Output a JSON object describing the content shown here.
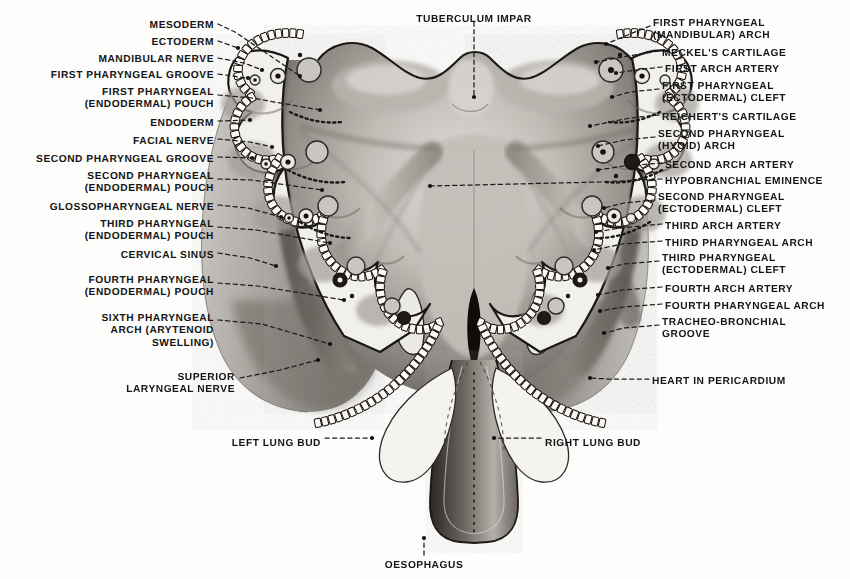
{
  "figure": {
    "type": "anatomical-illustration",
    "palette": {
      "paper": "#fdfdfc",
      "ink": "#151515",
      "arch_fill": "#f0efec",
      "tongue_mid": "#b5b0ab",
      "tongue_dark": "#6e6862",
      "tongue_light": "#d7d3ce",
      "body_grey": "#a8a39d",
      "body_dark": "#5e5954",
      "lumen_black": "#101010",
      "vessel_fill": "#c8c4bf",
      "leader": "#2a2a2a"
    }
  },
  "labels": {
    "top_center": [
      {
        "id": "tuberculum-impar",
        "text": "TUBERCULUM IMPAR",
        "x": 474,
        "y": 14,
        "align": "center"
      }
    ],
    "left": [
      {
        "id": "mesoderm",
        "text": "MESODERM",
        "x": 214,
        "y": 20,
        "align": "right"
      },
      {
        "id": "ectoderm",
        "text": "ECTODERM",
        "x": 214,
        "y": 37,
        "align": "right"
      },
      {
        "id": "mandibular-nerve",
        "text": "MANDIBULAR NERVE",
        "x": 214,
        "y": 54,
        "align": "right"
      },
      {
        "id": "first-pharyngeal-groove",
        "text": "FIRST PHARYNGEAL GROOVE",
        "x": 214,
        "y": 70,
        "align": "right"
      },
      {
        "id": "first-pharyngeal-pouch",
        "text": "FIRST PHARYNGEAL\n(ENDODERMAL) POUCH",
        "x": 214,
        "y": 87,
        "align": "right"
      },
      {
        "id": "endoderm",
        "text": "ENDODERM",
        "x": 214,
        "y": 118,
        "align": "right"
      },
      {
        "id": "facial-nerve",
        "text": "FACIAL NERVE",
        "x": 214,
        "y": 136,
        "align": "right"
      },
      {
        "id": "second-pharyngeal-groove",
        "text": "SECOND PHARYNGEAL GROOVE",
        "x": 214,
        "y": 154,
        "align": "right"
      },
      {
        "id": "second-pharyngeal-pouch",
        "text": "SECOND PHARYNGEAL\n(ENDODERMAL) POUCH",
        "x": 214,
        "y": 171,
        "align": "right"
      },
      {
        "id": "glossopharyngeal-nerve",
        "text": "GLOSSOPHARYNGEAL NERVE",
        "x": 214,
        "y": 202,
        "align": "right"
      },
      {
        "id": "third-pharyngeal-pouch",
        "text": "THIRD PHARYNGEAL\n(ENDODERMAL) POUCH",
        "x": 214,
        "y": 219,
        "align": "right"
      },
      {
        "id": "cervical-sinus",
        "text": "CERVICAL SINUS",
        "x": 214,
        "y": 250,
        "align": "right"
      },
      {
        "id": "fourth-pharyngeal-pouch",
        "text": "FOURTH PHARYNGEAL\n(ENDODERMAL) POUCH",
        "x": 214,
        "y": 275,
        "align": "right"
      },
      {
        "id": "sixth-pharyngeal-arch",
        "text": "SIXTH PHARYNGEAL\nARCH (ARYTENOID\nSWELLING)",
        "x": 214,
        "y": 313,
        "align": "right"
      },
      {
        "id": "superior-laryngeal-nerve",
        "text": "SUPERIOR\nLARYNGEAL NERVE",
        "x": 235,
        "y": 372,
        "align": "right"
      }
    ],
    "right": [
      {
        "id": "first-pharyngeal-arch",
        "text": "FIRST PHARYNGEAL\n(MANDIBULAR) ARCH",
        "x": 653,
        "y": 18,
        "align": "left"
      },
      {
        "id": "meckels-cartilage",
        "text": "MECKEL'S CARTILAGE",
        "x": 662,
        "y": 48,
        "align": "left"
      },
      {
        "id": "first-arch-artery",
        "text": "FIRST ARCH ARTERY",
        "x": 665,
        "y": 64,
        "align": "left"
      },
      {
        "id": "first-pharyngeal-cleft",
        "text": "FIRST PHARYNGEAL\n(ECTODERMAL) CLEFT",
        "x": 662,
        "y": 81,
        "align": "left"
      },
      {
        "id": "reicherts-cartilage",
        "text": "REICHERT'S CARTILAGE",
        "x": 662,
        "y": 112,
        "align": "left"
      },
      {
        "id": "second-pharyngeal-arch",
        "text": "SECOND PHARYNGEAL\n(HYOID) ARCH",
        "x": 658,
        "y": 129,
        "align": "left"
      },
      {
        "id": "second-arch-artery",
        "text": "SECOND ARCH ARTERY",
        "x": 665,
        "y": 160,
        "align": "left"
      },
      {
        "id": "hypobranchial-eminence",
        "text": "HYPOBRANCHIAL EMINENCE",
        "x": 665,
        "y": 176,
        "align": "left"
      },
      {
        "id": "second-pharyngeal-cleft",
        "text": "SECOND PHARYNGEAL\n(ECTODERMAL) CLEFT",
        "x": 658,
        "y": 192,
        "align": "left"
      },
      {
        "id": "third-arch-artery",
        "text": "THIRD ARCH ARTERY",
        "x": 665,
        "y": 221,
        "align": "left"
      },
      {
        "id": "third-pharyngeal-arch",
        "text": "THIRD PHARYNGEAL ARCH",
        "x": 665,
        "y": 238,
        "align": "left"
      },
      {
        "id": "third-pharyngeal-cleft",
        "text": "THIRD PHARYNGEAL\n(ECTODERMAL) CLEFT",
        "x": 662,
        "y": 253,
        "align": "left"
      },
      {
        "id": "fourth-arch-artery",
        "text": "FOURTH ARCH ARTERY",
        "x": 665,
        "y": 284,
        "align": "left"
      },
      {
        "id": "fourth-pharyngeal-arch",
        "text": "FOURTH PHARYNGEAL ARCH",
        "x": 665,
        "y": 301,
        "align": "left"
      },
      {
        "id": "tracheo-bronchial-groove",
        "text": "TRACHEO-BRONCHIAL\nGROOVE",
        "x": 662,
        "y": 317,
        "align": "left"
      },
      {
        "id": "heart-in-pericardium",
        "text": "HEART IN PERICARDIUM",
        "x": 652,
        "y": 376,
        "align": "left"
      }
    ],
    "bottom": [
      {
        "id": "left-lung-bud",
        "text": "LEFT LUNG BUD",
        "x": 321,
        "y": 438,
        "align": "right"
      },
      {
        "id": "right-lung-bud",
        "text": "RIGHT LUNG BUD",
        "x": 545,
        "y": 438,
        "align": "left"
      },
      {
        "id": "oesophagus",
        "text": "OESOPHAGUS",
        "x": 424,
        "y": 560,
        "align": "center"
      }
    ]
  },
  "leaders": {
    "note": "dashed leader lines from each label to its anatomical target",
    "left": [
      {
        "id": "leader-mesoderm",
        "d": "M 218 24 L 235 32 L 300 76"
      },
      {
        "id": "leader-ectoderm",
        "d": "M 218 41 L 238 48"
      },
      {
        "id": "leader-mandibular-nerve",
        "d": "M 218 58 L 244 63 L 262 70"
      },
      {
        "id": "leader-first-pharyngeal-groove",
        "d": "M 218 74 L 248 78"
      },
      {
        "id": "leader-first-pouch",
        "d": "M 218 95 L 252 98 L 320 110"
      },
      {
        "id": "leader-endoderm",
        "d": "M 218 121 L 250 120"
      },
      {
        "id": "leader-facial-nerve",
        "d": "M 218 139 L 250 142 L 272 147"
      },
      {
        "id": "leader-second-groove",
        "d": "M 218 157 L 252 158"
      },
      {
        "id": "leader-second-pouch",
        "d": "M 218 179 L 252 180 L 322 190"
      },
      {
        "id": "leader-glossopharyngeal",
        "d": "M 218 205 L 248 208 L 281 217"
      },
      {
        "id": "leader-third-pouch",
        "d": "M 218 227 L 256 230 L 330 243"
      },
      {
        "id": "leader-cervical-sinus",
        "d": "M 218 253 L 250 258 L 276 266"
      },
      {
        "id": "leader-fourth-pouch",
        "d": "M 218 283 L 258 286 L 344 300"
      },
      {
        "id": "leader-sixth-arch",
        "d": "M 218 320 L 262 324 L 330 344"
      },
      {
        "id": "leader-superior-laryngeal",
        "d": "M 240 378 L 280 370 L 318 360"
      }
    ],
    "right": [
      {
        "id": "leader-first-arch",
        "d": "M 650 26 L 630 34 L 606 44"
      },
      {
        "id": "leader-meckels",
        "d": "M 659 51 L 628 56 L 596 62"
      },
      {
        "id": "leader-first-artery",
        "d": "M 662 67 L 636 70 L 616 73"
      },
      {
        "id": "leader-first-cleft",
        "d": "M 659 89 L 630 92 L 612 97"
      },
      {
        "id": "leader-reicherts",
        "d": "M 659 115 L 630 118 L 590 126"
      },
      {
        "id": "leader-second-arch",
        "d": "M 655 137 L 624 140 L 598 146"
      },
      {
        "id": "leader-second-artery",
        "d": "M 662 163 L 624 166 L 598 170"
      },
      {
        "id": "leader-hypobranchial",
        "d": "M 662 179 L 600 182 L 430 186"
      },
      {
        "id": "leader-second-cleft",
        "d": "M 655 200 L 624 203 L 604 208"
      },
      {
        "id": "leader-third-artery",
        "d": "M 662 224 L 620 228 L 596 232"
      },
      {
        "id": "leader-third-arch",
        "d": "M 662 241 L 622 244 L 594 250"
      },
      {
        "id": "leader-third-cleft",
        "d": "M 659 261 L 624 264 L 608 268"
      },
      {
        "id": "leader-fourth-artery",
        "d": "M 662 287 L 622 290 L 598 295"
      },
      {
        "id": "leader-fourth-arch",
        "d": "M 662 304 L 624 307 L 600 311"
      },
      {
        "id": "leader-tracheo-groove",
        "d": "M 659 325 L 624 328 L 604 333"
      },
      {
        "id": "leader-heart",
        "d": "M 649 379 L 608 379 L 590 378"
      }
    ],
    "center": [
      {
        "id": "leader-tuberculum-impar",
        "d": "M 474 22 L 474 97"
      },
      {
        "id": "leader-left-lung-bud",
        "d": "M 325 438 L 372 438"
      },
      {
        "id": "leader-right-lung-bud",
        "d": "M 541 438 L 494 438"
      },
      {
        "id": "leader-oesophagus",
        "d": "M 424 555 L 424 538"
      }
    ]
  },
  "anatomy": {
    "structures": [
      "pharyngeal arches (1st-6th)",
      "pharyngeal pouches (endodermal)",
      "pharyngeal clefts (ectodermal)",
      "aortic arch arteries",
      "tuberculum impar",
      "hypobranchial eminence",
      "laryngeal aditus",
      "tracheo-bronchial groove",
      "lung buds",
      "oesophagus",
      "heart in pericardium",
      "cervical sinus"
    ]
  }
}
